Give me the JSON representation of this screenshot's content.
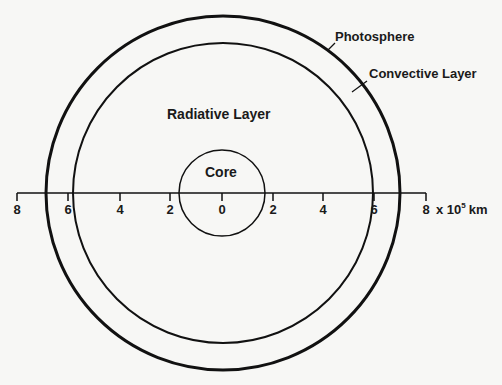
{
  "diagram": {
    "labels": {
      "photosphere": "Photosphere",
      "convective": "Convective Layer",
      "radiative": "Radiative Layer",
      "core": "Core"
    },
    "axis": {
      "ticks": [
        "8",
        "6",
        "4",
        "2",
        "0",
        "2",
        "4",
        "6",
        "8"
      ],
      "unit_prefix": "x 10",
      "unit_exp": "5",
      "unit_suffix": "km"
    },
    "colors": {
      "line": "#111111",
      "background": "#f7f7f5"
    }
  }
}
